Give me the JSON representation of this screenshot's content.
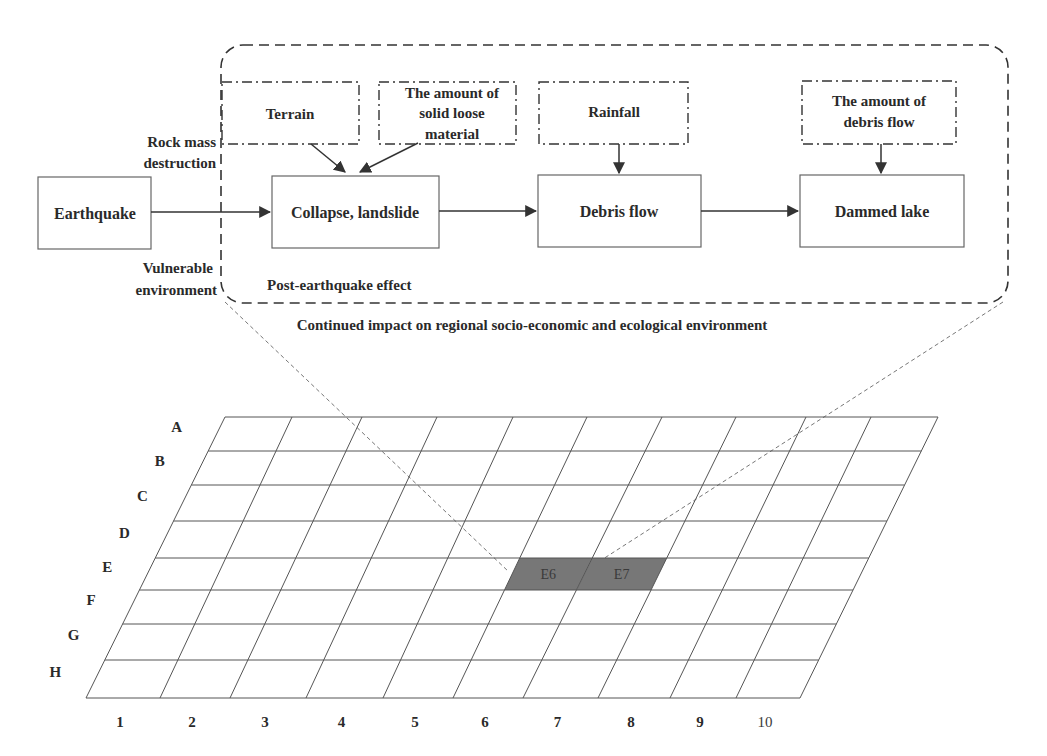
{
  "flowchart": {
    "outer_box": {
      "caption": "Continued impact on regional socio-economic and ecological environment",
      "inner_label": "Post-earthquake effect"
    },
    "side_labels": {
      "top": [
        "Rock mass",
        "destruction"
      ],
      "bottom": [
        "Vulnerable",
        "environment"
      ]
    },
    "process_boxes": [
      {
        "id": "earthquake",
        "label": "Earthquake"
      },
      {
        "id": "collapse",
        "label": "Collapse, landslide"
      },
      {
        "id": "debris",
        "label": "Debris flow"
      },
      {
        "id": "lake",
        "label": "Dammed lake"
      }
    ],
    "factor_boxes": [
      {
        "id": "terrain",
        "lines": [
          "Terrain"
        ],
        "feeds": "collapse"
      },
      {
        "id": "loose",
        "lines": [
          "The amount of",
          "solid loose",
          "material"
        ],
        "feeds": "collapse"
      },
      {
        "id": "rainfall",
        "lines": [
          "Rainfall"
        ],
        "feeds": "debris"
      },
      {
        "id": "debris_amount",
        "lines": [
          "The amount of",
          "debris flow"
        ],
        "feeds": "lake"
      }
    ]
  },
  "grid": {
    "row_labels": [
      "A",
      "B",
      "C",
      "D",
      "E",
      "F",
      "G",
      "H"
    ],
    "col_labels": [
      "1",
      "2",
      "3",
      "4",
      "5",
      "6",
      "7",
      "8",
      "9",
      "10"
    ],
    "highlighted_cells": [
      {
        "label": "E6",
        "row": 4,
        "col": 5
      },
      {
        "label": "E7",
        "row": 4,
        "col": 6
      }
    ],
    "highlight_color": "#777777",
    "line_color": "#555555"
  }
}
